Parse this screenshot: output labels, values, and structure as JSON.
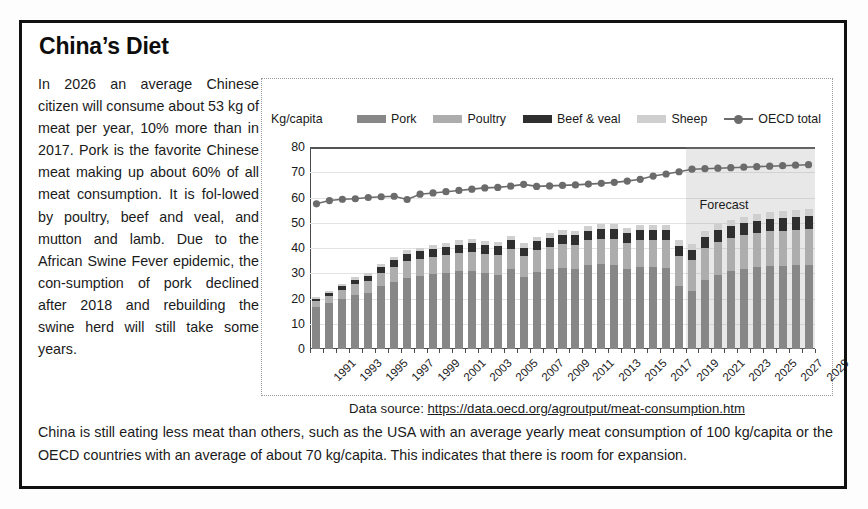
{
  "card": {
    "title": "China’s Diet",
    "intro_paragraph": "In 2026 an average Chinese citizen will consume about 53 kg of meat per year, 10% more than in 2017. Pork is the favorite Chinese meat making up about 60% of all meat consumption. It is fol-lowed by poultry, beef and veal, and mutton and lamb. Due to the African Swine Fever epidemic, the con-sumption of pork declined after 2018 and rebuilding the swine herd will still take some years.",
    "closing_paragraph": "China is still eating less meat than others, such as the USA with an average yearly meat consumption of 100 kg/capita or the OECD countries with an average of about 70 kg/capita. This indicates that there is room for expansion.",
    "source_label": "Data source:",
    "source_url": "https://data.oecd.org/agroutput/meat-consumption.htm"
  },
  "chart_data": {
    "type": "bar",
    "title": "",
    "subtitle": "",
    "unit_label": "Kg/capita",
    "xlabel": "",
    "ylabel": "Kg/capita",
    "ylim": [
      0,
      80
    ],
    "yticks": [
      0,
      10,
      20,
      30,
      40,
      50,
      60,
      70,
      80
    ],
    "grid": true,
    "legend_position": "top",
    "stacked": true,
    "annotation": "Forecast",
    "forecast_start_year": 2020,
    "colors": {
      "pork": "#878787",
      "poultry": "#adadad",
      "beef_veal": "#2f2f2f",
      "sheep": "#cfcfcf",
      "oecd_total": "#6b6b6b",
      "forecast_band": "#969696"
    },
    "x": [
      1991,
      1992,
      1993,
      1994,
      1995,
      1996,
      1997,
      1998,
      1999,
      2000,
      2001,
      2002,
      2003,
      2004,
      2005,
      2006,
      2007,
      2008,
      2009,
      2010,
      2011,
      2012,
      2013,
      2014,
      2015,
      2016,
      2017,
      2018,
      2019,
      2020,
      2021,
      2022,
      2023,
      2024,
      2025,
      2026,
      2027,
      2028,
      2029
    ],
    "tick_labels": [
      1991,
      1993,
      1995,
      1997,
      1999,
      2001,
      2003,
      2005,
      2007,
      2009,
      2011,
      2013,
      2015,
      2017,
      2019,
      2021,
      2023,
      2025,
      2027,
      2029
    ],
    "series": [
      {
        "name": "Pork",
        "key": "pork",
        "values": [
          16.5,
          18.2,
          20.0,
          21.4,
          22.3,
          24.8,
          26.6,
          28.3,
          29.0,
          29.6,
          30.2,
          30.8,
          31.0,
          30.1,
          29.5,
          31.5,
          28.6,
          30.5,
          31.5,
          32.0,
          31.6,
          33.2,
          33.6,
          33.4,
          31.7,
          32.6,
          32.4,
          32.0,
          25.0,
          22.8,
          27.3,
          29.5,
          30.8,
          31.7,
          32.4,
          32.8,
          33.0,
          33.2,
          33.4
        ]
      },
      {
        "name": "Poultry",
        "key": "poultry",
        "values": [
          2.4,
          2.8,
          3.4,
          4.2,
          4.7,
          5.4,
          6.0,
          6.6,
          6.8,
          7.0,
          7.2,
          7.4,
          7.6,
          7.6,
          7.8,
          8.0,
          8.2,
          8.6,
          9.0,
          9.4,
          9.7,
          9.9,
          10.0,
          10.1,
          10.3,
          10.5,
          10.7,
          11.0,
          11.8,
          12.3,
          12.7,
          13.0,
          13.2,
          13.4,
          13.6,
          13.8,
          13.9,
          14.0,
          14.1
        ]
      },
      {
        "name": "Beef & veal",
        "key": "beef_veal",
        "values": [
          1.0,
          1.2,
          1.5,
          1.8,
          2.0,
          2.3,
          2.6,
          2.8,
          2.9,
          3.0,
          3.1,
          3.2,
          3.3,
          3.3,
          3.4,
          3.5,
          3.4,
          3.5,
          3.6,
          3.7,
          3.7,
          3.8,
          3.9,
          3.9,
          3.9,
          4.0,
          4.0,
          4.1,
          4.2,
          4.3,
          4.4,
          4.5,
          4.6,
          4.7,
          4.8,
          4.9,
          4.9,
          5.0,
          5.0
        ]
      },
      {
        "name": "Sheep",
        "key": "sheep",
        "values": [
          0.7,
          0.8,
          0.9,
          1.0,
          1.1,
          1.2,
          1.3,
          1.4,
          1.4,
          1.5,
          1.5,
          1.6,
          1.6,
          1.6,
          1.7,
          1.7,
          1.7,
          1.8,
          1.8,
          1.9,
          1.9,
          2.0,
          2.0,
          2.0,
          2.1,
          2.1,
          2.2,
          2.2,
          2.3,
          2.4,
          2.4,
          2.5,
          2.5,
          2.6,
          2.6,
          2.7,
          2.7,
          2.8,
          2.8
        ]
      },
      {
        "name": "OECD total",
        "key": "oecd_total",
        "type": "line",
        "values": [
          57.5,
          58.8,
          59.3,
          59.5,
          60.0,
          60.3,
          60.5,
          59.2,
          61.3,
          61.8,
          62.3,
          62.8,
          63.3,
          63.8,
          64.0,
          64.5,
          65.2,
          64.4,
          64.6,
          64.8,
          65.0,
          65.3,
          65.6,
          66.0,
          66.5,
          67.2,
          68.5,
          69.3,
          70.2,
          71.2,
          71.4,
          71.6,
          71.8,
          72.0,
          72.2,
          72.4,
          72.6,
          72.8,
          73.0
        ]
      }
    ]
  },
  "legend": [
    {
      "label": "Pork",
      "key": "pork",
      "swatch": "legend-swatch-pork"
    },
    {
      "label": "Poultry",
      "key": "poultry",
      "swatch": "legend-swatch-poultry"
    },
    {
      "label": "Beef & veal",
      "key": "beef_veal",
      "swatch": "legend-swatch-beef-veal"
    },
    {
      "label": "Sheep",
      "key": "sheep",
      "swatch": "legend-swatch-sheep"
    },
    {
      "label": "OECD total",
      "key": "oecd_total",
      "swatch": "legend-line-oecd-total"
    }
  ]
}
